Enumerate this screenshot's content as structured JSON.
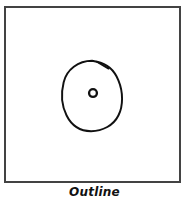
{
  "figure": {
    "caption": "Outline",
    "frame": {
      "border_color": "#434343",
      "background_color": "#ffffff",
      "border_width_px": 2
    },
    "drawing": {
      "style": "hand-drawn ink sketch",
      "stroke_color": "#111111",
      "stroke_width_px": 2,
      "shapes": [
        {
          "name": "outer-blob-outline",
          "kind": "closed-freehand-circle",
          "description": "large irregular hand-drawn circle with a small pen overlap notch at the upper right",
          "center_x": 92,
          "center_y": 91,
          "radius_x": 26,
          "radius_y": 31
        },
        {
          "name": "inner-dot-outline",
          "kind": "small-circle",
          "description": "small open circle at the centre of the blob",
          "center_x": 93,
          "center_y": 93,
          "radius": 4
        }
      ]
    }
  }
}
